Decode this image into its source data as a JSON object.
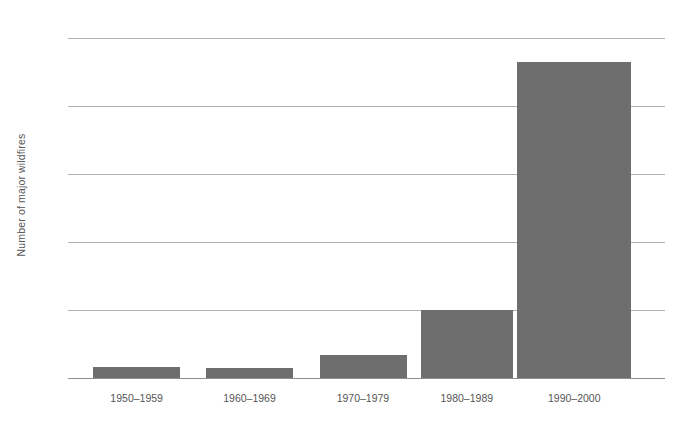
{
  "chart_data": {
    "type": "bar",
    "title": "",
    "subtitle": "",
    "xlabel": "",
    "ylabel": "Number of major wildfires",
    "categories": [
      "1950–1959",
      "1960–1969",
      "1970–1979",
      "1980–1989",
      "1990–2000"
    ],
    "values": [
      1.6,
      1.5,
      3.4,
      10,
      46.5
    ],
    "ylim": [
      0,
      50
    ],
    "yticks": [
      0,
      10,
      20,
      30,
      40,
      50
    ],
    "ytick_labels": [
      "0",
      "10",
      "20",
      "30",
      "40",
      "50"
    ],
    "grid": "horizontal",
    "legend": "none",
    "series": [
      {
        "name": "Number of major wildfires",
        "values": [
          1.6,
          1.5,
          3.4,
          10,
          46.5
        ]
      }
    ],
    "colors": {
      "bar": "#6e6e6e",
      "gridline": "#b3b3b3",
      "baseline": "#8f8f8f",
      "text": "#555555",
      "background": "#ffffff"
    },
    "bar_geometry": [
      {
        "left_pct": 4.2,
        "width_pct": 14.6
      },
      {
        "left_pct": 23.1,
        "width_pct": 14.6
      },
      {
        "left_pct": 42.2,
        "width_pct": 14.6
      },
      {
        "left_pct": 59.1,
        "width_pct": 15.4
      },
      {
        "left_pct": 75.2,
        "width_pct": 19.1
      }
    ],
    "label_geometry": [
      {
        "center_pct": 11.5
      },
      {
        "center_pct": 30.4
      },
      {
        "center_pct": 49.4
      },
      {
        "center_pct": 66.8
      },
      {
        "center_pct": 84.8
      }
    ]
  }
}
